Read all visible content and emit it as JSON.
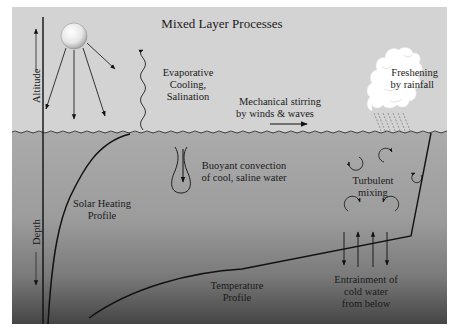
{
  "title": "Mixed Layer Processes",
  "axes": {
    "altitude_label": "Altitude",
    "depth_label": "Depth"
  },
  "labels": {
    "evaporative": [
      "Evaporative",
      "Cooling,",
      "Salination"
    ],
    "mechanical": [
      "Mechanical stirring",
      "by winds & waves"
    ],
    "freshening": [
      "Freshening",
      "by rainfall"
    ],
    "buoyant": [
      "Buoyant convection",
      "of cool, saline water"
    ],
    "solar_profile": [
      "Solar Heating",
      "Profile"
    ],
    "turbulent": [
      "Turbulent",
      "mixing"
    ],
    "temperature_profile": [
      "Temperature",
      "Profile"
    ],
    "entrainment": [
      "Entrainment of",
      "cold water",
      "from below"
    ]
  },
  "colors": {
    "sky": "#d3d3d3",
    "water_top": "#ababab",
    "water_bottom": "#474747",
    "line": "#111111",
    "page_bg": "#ffffff"
  }
}
